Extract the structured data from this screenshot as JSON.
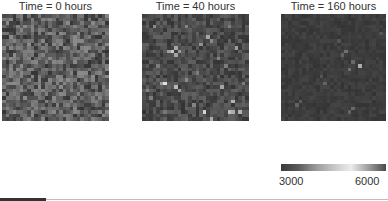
{
  "chart_data": {
    "type": "heatmap",
    "title": "",
    "panels": [
      {
        "title": "Time = 0 hours",
        "grid": [
          30,
          30
        ],
        "description": "Uniform random noise, values mostly 3000-4200",
        "value_range": [
          3000,
          4300
        ],
        "seed": 11,
        "bright_spots": []
      },
      {
        "title": "Time = 40 hours",
        "grid": [
          30,
          30
        ],
        "description": "Darker background with scattered bright cells",
        "value_range": [
          3000,
          3700
        ],
        "seed": 23,
        "bright_spots": [
          [
            8,
            10,
            5200
          ],
          [
            9,
            9,
            4700
          ],
          [
            9,
            11,
            4700
          ],
          [
            7,
            10,
            4600
          ],
          [
            10,
            10,
            4500
          ],
          [
            6,
            19,
            5600
          ],
          [
            5,
            19,
            4600
          ],
          [
            9,
            20,
            5000
          ],
          [
            10,
            21,
            4500
          ],
          [
            12,
            18,
            4300
          ],
          [
            3,
            3,
            4300
          ],
          [
            12,
            3,
            4200
          ],
          [
            18,
            6,
            4700
          ],
          [
            19,
            7,
            4300
          ],
          [
            26,
            9,
            4600
          ],
          [
            24,
            3,
            4100
          ],
          [
            16,
            8,
            4400
          ],
          [
            22,
            20,
            4700
          ],
          [
            25,
            24,
            4900
          ],
          [
            24,
            27,
            5100
          ],
          [
            27,
            27,
            4900
          ],
          [
            17,
            27,
            5400
          ],
          [
            25,
            27,
            4800
          ],
          [
            19,
            29,
            4800
          ],
          [
            2,
            23,
            4100
          ],
          [
            14,
            25,
            4200
          ],
          [
            21,
            12,
            4200
          ],
          [
            23,
            14,
            4100
          ],
          [
            1,
            21,
            4200
          ],
          [
            28,
            19,
            4100
          ],
          [
            6,
            27,
            4000
          ],
          [
            4,
            14,
            4100
          ],
          [
            15,
            16,
            4100
          ]
        ]
      },
      {
        "title": "Time = 160 hours",
        "grid": [
          30,
          30
        ],
        "description": "Almost uniformly dark, few faint spots",
        "value_range": [
          3000,
          3250
        ],
        "seed": 41,
        "bright_spots": [
          [
            22,
            14,
            4800
          ],
          [
            18,
            10,
            3900
          ],
          [
            17,
            11,
            3700
          ],
          [
            20,
            13,
            3800
          ],
          [
            19,
            15,
            3900
          ],
          [
            12,
            19,
            3700
          ],
          [
            11,
            17,
            3500
          ],
          [
            20,
            26,
            3800
          ],
          [
            19,
            27,
            3700
          ],
          [
            4,
            25,
            3700
          ],
          [
            5,
            24,
            3600
          ],
          [
            16,
            7,
            3500
          ],
          [
            28,
            5,
            3500
          ]
        ]
      }
    ],
    "colorbar": {
      "min": 3000,
      "max": 6000,
      "tick_labels": [
        "3000",
        "6000"
      ],
      "orientation": "horizontal",
      "colormap_stops": [
        "#3a3a3a",
        "#5b5b5b",
        "#9a9a9a",
        "#c6c6c6",
        "#ececec",
        "#9d9d9d",
        "#4a4a4a"
      ]
    },
    "xlabel": "",
    "ylabel": "",
    "grid": false
  },
  "panels": {
    "p0": {
      "title": "Time = 0 hours"
    },
    "p1": {
      "title": "Time = 40 hours"
    },
    "p2": {
      "title": "Time = 160 hours"
    }
  },
  "colorbar": {
    "min_label": "3000",
    "max_label": "6000"
  }
}
